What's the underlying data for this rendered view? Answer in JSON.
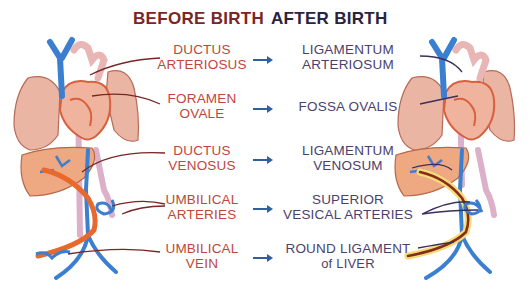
{
  "titles": {
    "before": "BEFORE BIRTH",
    "after": "AFTER BIRTH"
  },
  "rows": [
    {
      "before": [
        "DUCTUS",
        "ARTERIOSUS"
      ],
      "after": [
        "LIGAMENTUM",
        "ARTERIOSUM"
      ]
    },
    {
      "before": [
        "FORAMEN",
        "OVALE"
      ],
      "after": [
        "FOSSA OVALIS",
        ""
      ]
    },
    {
      "before": [
        "DUCTUS",
        "VENOSUS"
      ],
      "after": [
        "LIGAMENTUM",
        "VENOSUM"
      ]
    },
    {
      "before": [
        "UMBILICAL",
        "ARTERIES"
      ],
      "after": [
        "SUPERIOR",
        "VESICAL ARTERIES"
      ]
    },
    {
      "before": [
        "UMBILICAL",
        "VEIN"
      ],
      "after": [
        "ROUND LIGAMENT",
        "of LIVER"
      ]
    }
  ],
  "colors": {
    "before_title": "#7a2626",
    "after_title": "#2a2340",
    "before_text": "#c0463c",
    "after_text": "#4c3f6e",
    "arrow": "#2f5fa0",
    "vein_blue": "#3a7fd0",
    "artery_pink": "#e8b6b4",
    "heart_red": "#e06a4a",
    "lung": "#e8b29e",
    "liver": "#eea882",
    "umbilical_orange": "#e8682e",
    "ligament_yellow": "#f2dc7a",
    "leader_before": "#7a2626",
    "leader_after": "#3b2f5c"
  },
  "illustrations": {
    "left": "fetal-circulation-icon",
    "right": "postnatal-circulation-icon"
  }
}
